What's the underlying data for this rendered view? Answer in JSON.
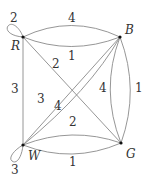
{
  "graph": {
    "vertices": [
      {
        "id": "R",
        "label": "R"
      },
      {
        "id": "B",
        "label": "B"
      },
      {
        "id": "W",
        "label": "W"
      },
      {
        "id": "G",
        "label": "G"
      }
    ],
    "edges": [
      {
        "from": "R",
        "to": "R",
        "weight": "2",
        "type": "loop"
      },
      {
        "from": "R",
        "to": "B",
        "weight": "4"
      },
      {
        "from": "R",
        "to": "B",
        "weight": "1"
      },
      {
        "from": "R",
        "to": "W",
        "weight": "3"
      },
      {
        "from": "R",
        "to": "G",
        "weight": "2"
      },
      {
        "from": "B",
        "to": "W",
        "weight": "3"
      },
      {
        "from": "B",
        "to": "W",
        "weight": "4"
      },
      {
        "from": "B",
        "to": "G",
        "weight": "4"
      },
      {
        "from": "B",
        "to": "G",
        "weight": "1"
      },
      {
        "from": "W",
        "to": "G",
        "weight": "2"
      },
      {
        "from": "W",
        "to": "G",
        "weight": "1"
      },
      {
        "from": "W",
        "to": "W",
        "weight": "3",
        "type": "loop"
      }
    ]
  }
}
